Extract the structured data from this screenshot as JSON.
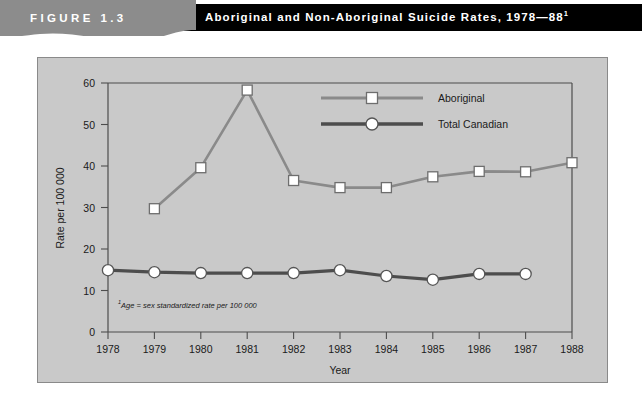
{
  "header": {
    "figure_label": "FIGURE 1.3",
    "title": "Aboriginal and Non-Aboriginal Suicide Rates, 1978—88",
    "title_superscript": "1",
    "banner_color": "#8c8c8c",
    "title_bar_color": "#000000",
    "title_text_color": "#ffffff"
  },
  "chart_data": {
    "type": "line",
    "title": "",
    "xlabel": "Year",
    "ylabel": "Rate per 100 000",
    "categories": [
      "1978",
      "1979",
      "1980",
      "1981",
      "1982",
      "1983",
      "1984",
      "1985",
      "1986",
      "1987",
      "1988"
    ],
    "x": [
      1978,
      1979,
      1980,
      1981,
      1982,
      1983,
      1984,
      1985,
      1986,
      1987,
      1988
    ],
    "xlim": [
      1978,
      1988
    ],
    "ylim": [
      0,
      60
    ],
    "yticks": [
      0,
      10,
      20,
      30,
      40,
      50,
      60
    ],
    "ytick_labels": [
      "0",
      "10",
      "20",
      "30",
      "40",
      "50",
      "60"
    ],
    "grid": false,
    "legend_position": "top-right",
    "series": [
      {
        "name": "Aboriginal",
        "marker": "square",
        "color": "#8a8a8a",
        "x": [
          1979,
          1980,
          1981,
          1982,
          1983,
          1984,
          1985,
          1986,
          1987,
          1988
        ],
        "values": [
          29.7,
          39.6,
          58.3,
          36.5,
          34.8,
          34.8,
          37.4,
          38.7,
          38.6,
          40.8
        ]
      },
      {
        "name": "Total Canadian",
        "marker": "circle",
        "color": "#4d4d4d",
        "x": [
          1978,
          1979,
          1980,
          1981,
          1982,
          1983,
          1984,
          1985,
          1986,
          1987
        ],
        "values": [
          14.9,
          14.4,
          14.2,
          14.2,
          14.2,
          14.9,
          13.5,
          12.6,
          14.0,
          14.0
        ]
      }
    ],
    "footnote": "Age = sex standardized rate per 100 000",
    "footnote_superscript": "1",
    "panel_background": "#c9c9c9",
    "axis_color": "#4d4d4d"
  }
}
